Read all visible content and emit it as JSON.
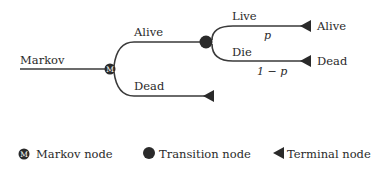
{
  "diagram": {
    "root_label": "Markov",
    "markov_node_glyph": "M",
    "branches": {
      "alive": {
        "label": "Alive"
      },
      "dead": {
        "label": "Dead"
      }
    },
    "transition": {
      "live": {
        "label": "Live",
        "probability": "p",
        "terminal_label": "Alive"
      },
      "die": {
        "label": "Die",
        "probability": "1 − p",
        "terminal_label": "Dead"
      }
    }
  },
  "legend": {
    "items": [
      {
        "icon": "markov-node-icon",
        "glyph": "M",
        "label": "Markov node"
      },
      {
        "icon": "transition-node-icon",
        "label": "Transition node"
      },
      {
        "icon": "terminal-node-icon",
        "label": "Terminal node"
      }
    ]
  },
  "colors": {
    "line": "#3a3a3a",
    "node_fill": "#2a2a2a",
    "text": "#2a2a2a",
    "background": "#ffffff"
  }
}
